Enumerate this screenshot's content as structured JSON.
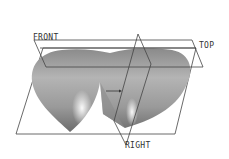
{
  "viewport": {
    "background": "#ffffff",
    "model": "heart-shaped-solid"
  },
  "datum_planes": [
    {
      "id": "front",
      "label": "FRONT"
    },
    {
      "id": "top",
      "label": "TOP"
    },
    {
      "id": "right",
      "label": "RIGHT"
    }
  ],
  "colors": {
    "plane_edge": "#444444",
    "solid_light": "#e8e8e8",
    "solid_mid": "#a8a8a8",
    "solid_dark": "#6e6e6e"
  }
}
